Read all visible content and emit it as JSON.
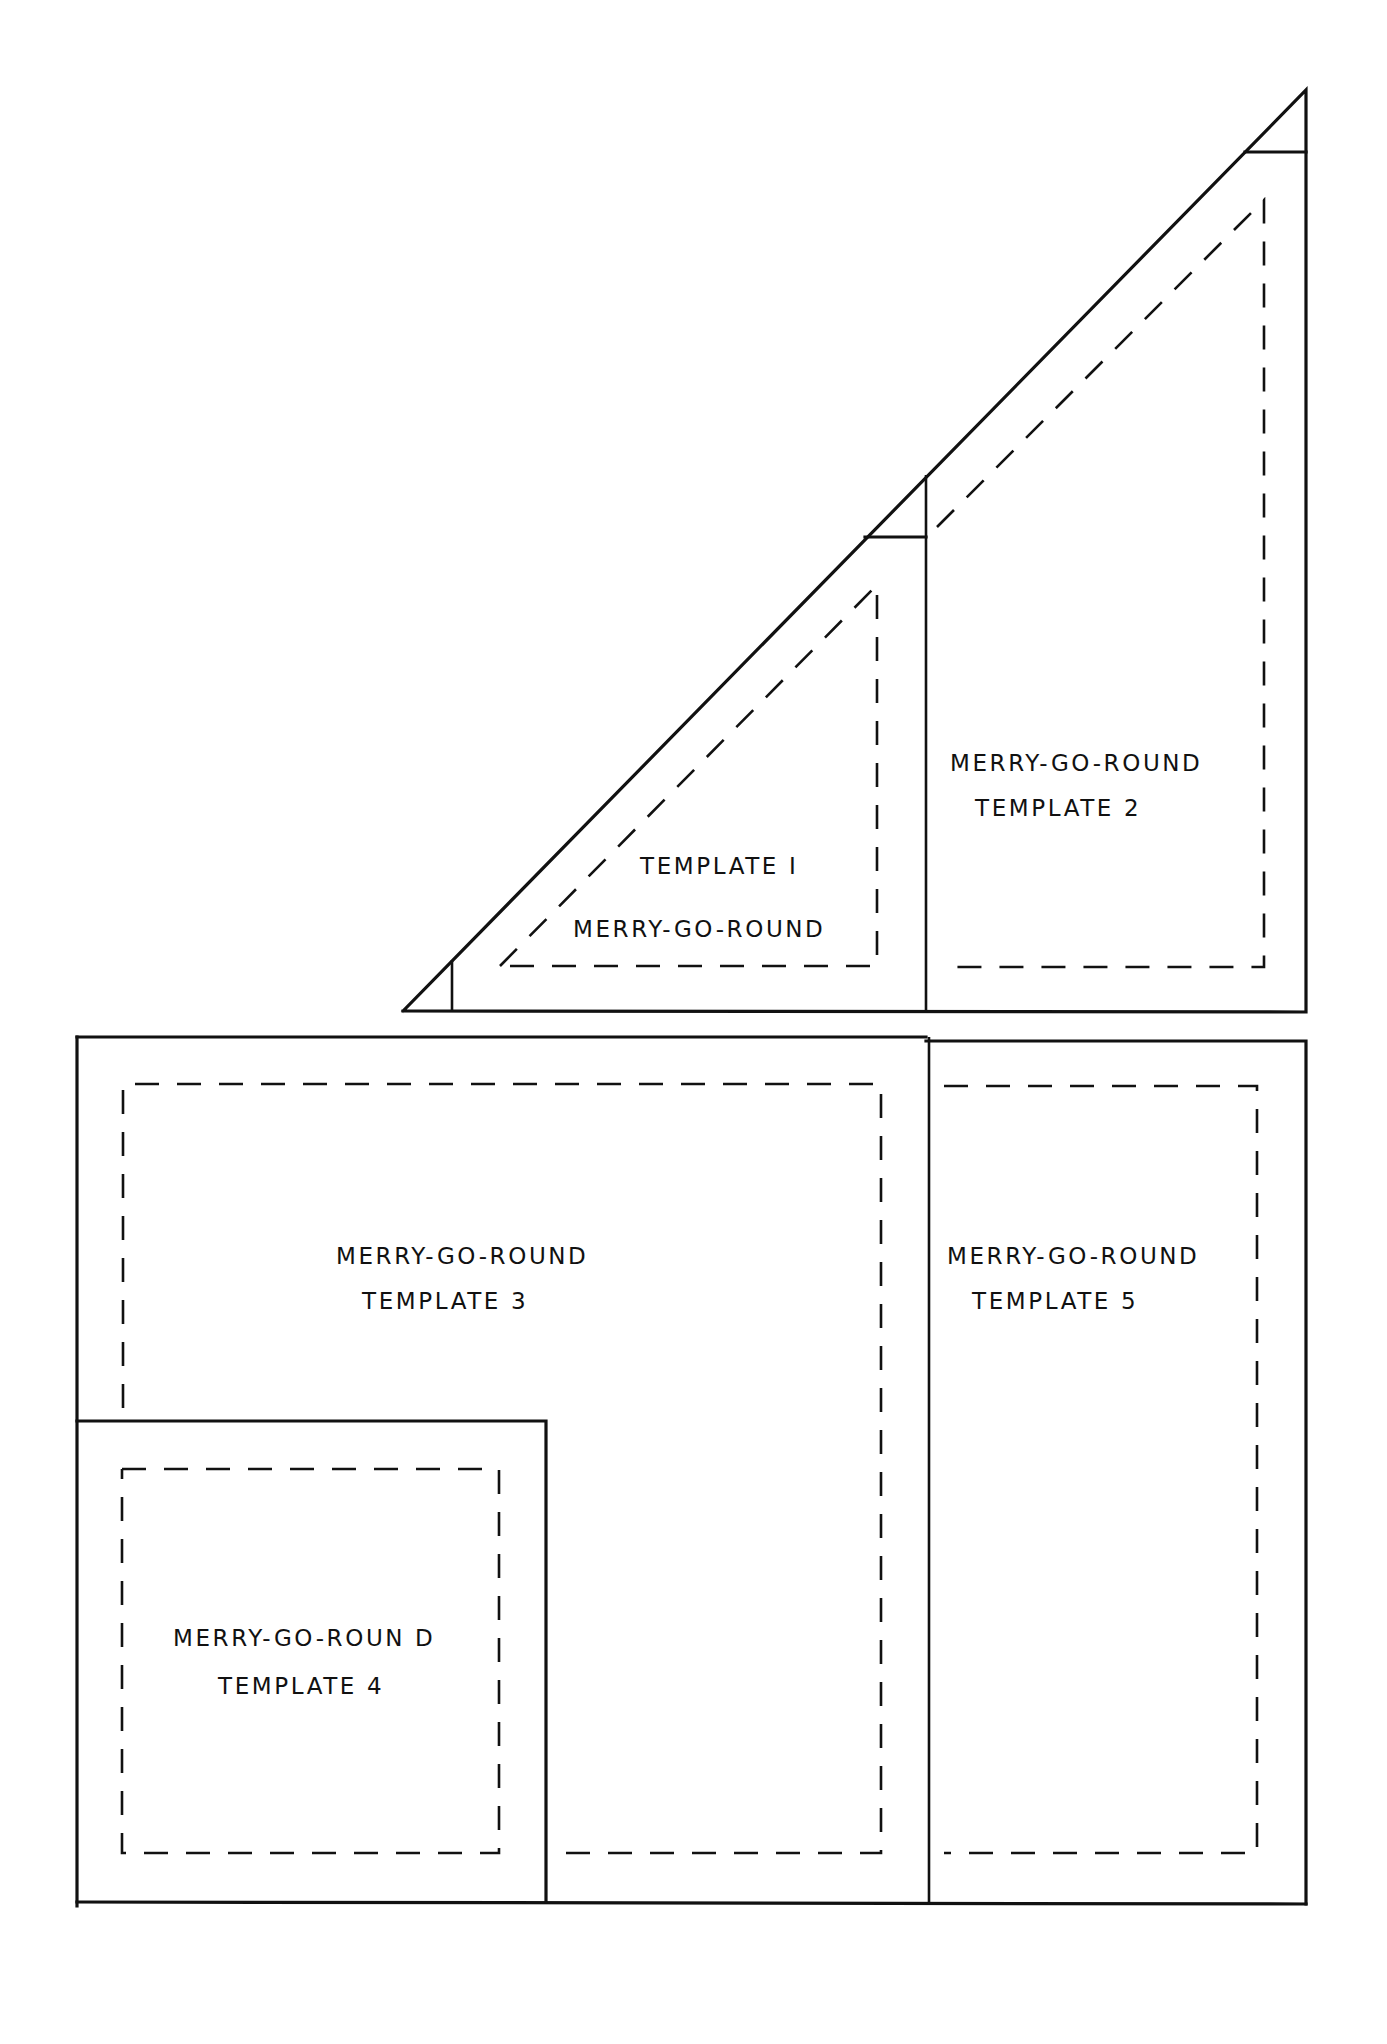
{
  "diagram": {
    "type": "quilt-template-pattern",
    "colors": {
      "line": "#111111",
      "background": "#ffffff"
    },
    "legend": {
      "solid_line": "cutting line",
      "dashed_line": "seam line"
    },
    "templates": [
      {
        "id": 1,
        "shape": "right-triangle",
        "line1": "TEMPLATE I",
        "line2": "MERRY-GO-ROUND"
      },
      {
        "id": 2,
        "shape": "trapezoid",
        "line1": "MERRY-GO-ROUND",
        "line2": "TEMPLATE 2"
      },
      {
        "id": 3,
        "shape": "L-shape",
        "line1": "MERRY-GO-ROUND",
        "line2": "TEMPLATE 3"
      },
      {
        "id": 4,
        "shape": "square",
        "line1": "MERRY-GO-ROUN D",
        "line2": "TEMPLATE 4"
      },
      {
        "id": 5,
        "shape": "rectangle",
        "line1": "MERRY-GO-ROUND",
        "line2": "TEMPLATE 5"
      }
    ]
  }
}
